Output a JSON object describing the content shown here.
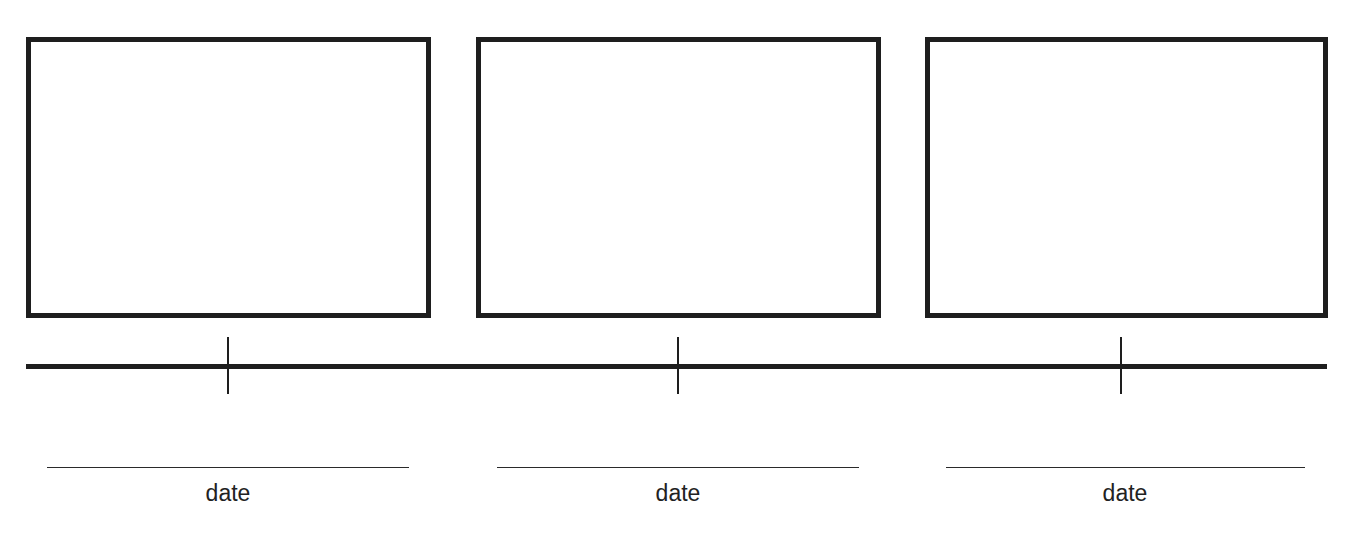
{
  "diagram": {
    "type": "timeline-storyboard",
    "colors": {
      "stroke": "#1e1e1e",
      "background": "#ffffff",
      "text": "#222222"
    },
    "panels": [
      {
        "index": 1,
        "content": ""
      },
      {
        "index": 2,
        "content": ""
      },
      {
        "index": 3,
        "content": ""
      }
    ],
    "timeline": {
      "tick_count": 3
    },
    "date_fields": [
      {
        "value": "",
        "label": "date"
      },
      {
        "value": "",
        "label": "date"
      },
      {
        "value": "",
        "label": "date"
      }
    ]
  }
}
